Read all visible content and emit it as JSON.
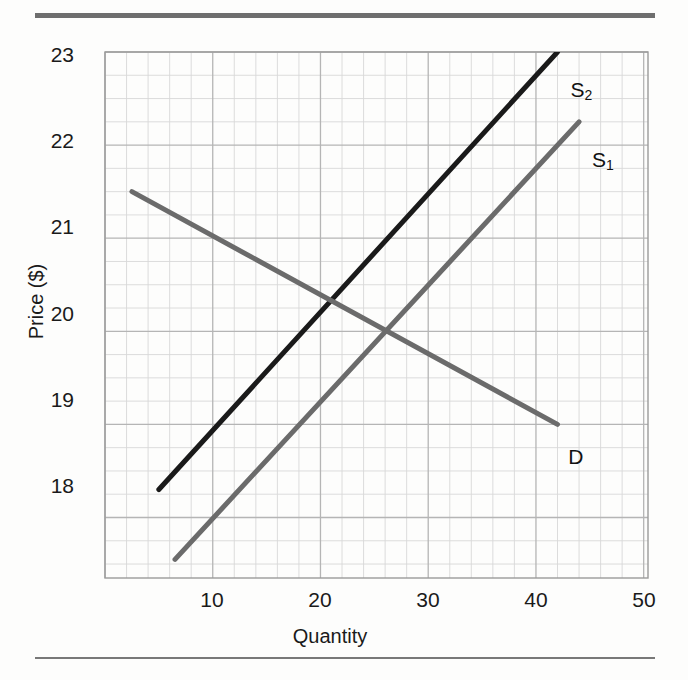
{
  "chart_data": {
    "type": "line",
    "title": "",
    "xlabel": "Quantity",
    "ylabel": "Price ($)",
    "xlim": [
      0,
      50.4
    ],
    "ylim": [
      17.35,
      23.0
    ],
    "xticks": [
      10,
      20,
      30,
      40,
      50
    ],
    "yticks": [
      18,
      19,
      20,
      21,
      22,
      23
    ],
    "grid": true,
    "grid_minor_x_step": 2,
    "grid_minor_y_step": 0.25,
    "grid_major_x_step": 10,
    "grid_major_y_step": 1,
    "legend": "inline-labels",
    "series": [
      {
        "name": "S2",
        "label": "S",
        "label_sub": "2",
        "color": "#1a1a1a",
        "width": 5,
        "points": [
          [
            5.0,
            18.3
          ],
          [
            42.0,
            23.0
          ]
        ],
        "label_pos": [
          43.2,
          22.72
        ]
      },
      {
        "name": "S1",
        "label": "S",
        "label_sub": "1",
        "color": "#6b6b6b",
        "width": 5,
        "points": [
          [
            6.5,
            17.55
          ],
          [
            44.0,
            22.25
          ]
        ],
        "label_pos": [
          45.2,
          21.97
        ]
      },
      {
        "name": "D",
        "label": "D",
        "label_sub": "",
        "color": "#6b6b6b",
        "width": 5,
        "points": [
          [
            2.5,
            21.5
          ],
          [
            42.0,
            19.0
          ]
        ],
        "label_pos": [
          43.0,
          18.78
        ]
      }
    ],
    "intersections": [
      {
        "curves": [
          "S2",
          "D"
        ],
        "quantity": 21,
        "price": 20.35
      },
      {
        "curves": [
          "S1",
          "D"
        ],
        "quantity": 26,
        "price": 20.0
      }
    ]
  },
  "axes": {
    "y_tick_labels": [
      "23",
      "22",
      "21",
      "20",
      "19",
      "18"
    ],
    "x_tick_labels": [
      "10",
      "20",
      "30",
      "40",
      "50"
    ],
    "y_title": "Price ($)",
    "x_title": "Quantity"
  },
  "curve_labels": {
    "s2_base": "S",
    "s2_sub": "2",
    "s1_base": "S",
    "s1_sub": "1",
    "d": "D"
  },
  "colors": {
    "supply_shifted": "#1a1a1a",
    "supply_original": "#6b6b6b",
    "demand": "#6b6b6b",
    "grid_minor": "#d8d8d8",
    "grid_major": "#b5b5b5",
    "plot_border": "#9a9a9a",
    "rule": "#6e6e6e",
    "text": "#1a1a1a"
  }
}
